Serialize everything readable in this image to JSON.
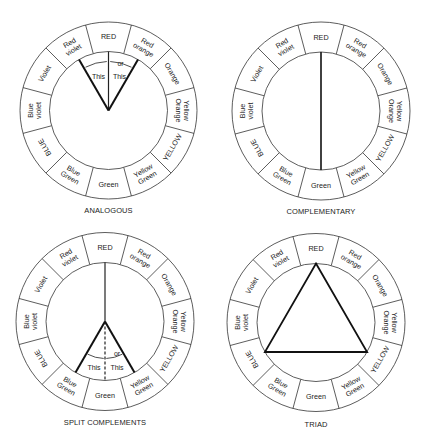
{
  "segments": [
    {
      "lines": [
        "RED"
      ],
      "angle": 0,
      "flip": false
    },
    {
      "lines": [
        "Red",
        "orange"
      ],
      "angle": 30,
      "flip": false
    },
    {
      "lines": [
        "Orange"
      ],
      "angle": 60,
      "flip": false
    },
    {
      "lines": [
        "Yellow",
        "Orange"
      ],
      "angle": 90,
      "flip": false
    },
    {
      "lines": [
        "YELLOW"
      ],
      "angle": 120,
      "flip": true
    },
    {
      "lines": [
        "Yellow",
        "Green"
      ],
      "angle": 150,
      "flip": true
    },
    {
      "lines": [
        "Green"
      ],
      "angle": 180,
      "flip": true
    },
    {
      "lines": [
        "Blue",
        "Green"
      ],
      "angle": 210,
      "flip": true
    },
    {
      "lines": [
        "BLUE"
      ],
      "angle": 240,
      "flip": false
    },
    {
      "lines": [
        "Blue",
        "violet"
      ],
      "angle": 270,
      "flip": false
    },
    {
      "lines": [
        "Violet"
      ],
      "angle": 300,
      "flip": false
    },
    {
      "lines": [
        "Red",
        "violet"
      ],
      "angle": 330,
      "flip": false
    }
  ],
  "wheels": [
    {
      "id": "analogous",
      "caption": "ANALOGOUS",
      "cx": 108.5,
      "cy": 110.5,
      "r_outer": 88.5,
      "r_inner": 59,
      "caption_y": 213,
      "annotations": {
        "left": "This",
        "or": "or",
        "right": "This"
      }
    },
    {
      "id": "complementary",
      "caption": "COMPLEMENTARY",
      "cx": 321,
      "cy": 111,
      "r_outer": 89,
      "r_inner": 59,
      "caption_y": 214
    },
    {
      "id": "split-complements",
      "caption": "SPLIT COMPLEMENTS",
      "cx": 105,
      "cy": 321.5,
      "r_outer": 89,
      "r_inner": 59,
      "caption_y": 425,
      "annotations": {
        "left": "This",
        "or": "or",
        "right": "This"
      }
    },
    {
      "id": "triad",
      "caption": "TRIAD",
      "cx": 316,
      "cy": 322.5,
      "r_outer": 89,
      "r_inner": 59,
      "caption_y": 427
    }
  ]
}
